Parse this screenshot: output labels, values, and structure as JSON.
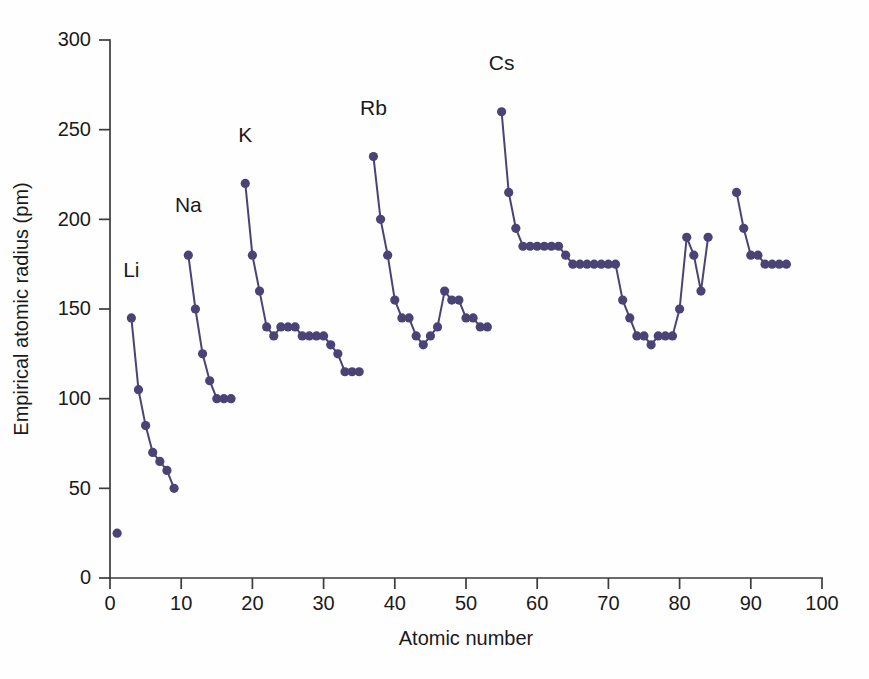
{
  "chart_data": {
    "type": "line",
    "title": "",
    "xlabel": "Atomic number",
    "ylabel": "Empirical atomic radius (pm)",
    "xlim": [
      0,
      100
    ],
    "ylim": [
      0,
      300
    ],
    "xticks": [
      0,
      10,
      20,
      30,
      40,
      50,
      60,
      70,
      80,
      90,
      100
    ],
    "yticks": [
      0,
      50,
      100,
      150,
      200,
      250,
      300
    ],
    "grid": false,
    "legend": "none",
    "marker": "filled-circle",
    "color": "#4a4376",
    "annotations": [
      {
        "text": "Li",
        "x": 3,
        "y": 168
      },
      {
        "text": "Na",
        "x": 11,
        "y": 204
      },
      {
        "text": "K",
        "x": 19,
        "y": 243
      },
      {
        "text": "Rb",
        "x": 37,
        "y": 258
      },
      {
        "text": "Cs",
        "x": 55,
        "y": 283
      }
    ],
    "series": [
      {
        "name": "hydrogen",
        "connected": false,
        "x": [
          1
        ],
        "values": [
          25
        ]
      },
      {
        "name": "period-2",
        "connected": true,
        "x": [
          3,
          4,
          5,
          6,
          7,
          8,
          9
        ],
        "values": [
          145,
          105,
          85,
          70,
          65,
          60,
          50
        ]
      },
      {
        "name": "period-3",
        "connected": true,
        "x": [
          11,
          12,
          13,
          14,
          15,
          16,
          17
        ],
        "values": [
          180,
          150,
          125,
          110,
          100,
          100,
          100
        ]
      },
      {
        "name": "period-4",
        "connected": true,
        "x": [
          19,
          20,
          21,
          22,
          23,
          24,
          25,
          26,
          27,
          28,
          29,
          30,
          31,
          32,
          33,
          34,
          35
        ],
        "values": [
          220,
          180,
          160,
          140,
          135,
          140,
          140,
          140,
          135,
          135,
          135,
          135,
          130,
          125,
          115,
          115,
          115
        ]
      },
      {
        "name": "period-5",
        "connected": true,
        "x": [
          37,
          38,
          39,
          40,
          41,
          42,
          43,
          44,
          45,
          46,
          47,
          48,
          49,
          50,
          51,
          52,
          53
        ],
        "values": [
          235,
          200,
          180,
          155,
          145,
          145,
          135,
          130,
          135,
          140,
          160,
          155,
          155,
          145,
          145,
          140,
          140
        ]
      },
      {
        "name": "period-6",
        "connected": true,
        "x": [
          55,
          56,
          57,
          58,
          59,
          60,
          61,
          62,
          63,
          64,
          65,
          66,
          67,
          68,
          69,
          70,
          71,
          72,
          73,
          74,
          75,
          76,
          77,
          78,
          79,
          80,
          81,
          82,
          83,
          84
        ],
        "values": [
          260,
          215,
          195,
          185,
          185,
          185,
          185,
          185,
          185,
          180,
          175,
          175,
          175,
          175,
          175,
          175,
          175,
          155,
          145,
          135,
          135,
          130,
          135,
          135,
          135,
          150,
          190,
          180,
          160,
          190
        ]
      },
      {
        "name": "period-7",
        "connected": true,
        "x": [
          88,
          89,
          90,
          91,
          92,
          93,
          94,
          95
        ],
        "values": [
          215,
          195,
          180,
          180,
          175,
          175,
          175,
          175
        ]
      }
    ]
  },
  "axes": {
    "x_tick_labels": [
      "0",
      "10",
      "20",
      "30",
      "40",
      "50",
      "60",
      "70",
      "80",
      "90",
      "100"
    ],
    "y_tick_labels": [
      "0",
      "50",
      "100",
      "150",
      "200",
      "250",
      "300"
    ],
    "x_title": "Atomic number",
    "y_title": "Empirical atomic radius (pm)"
  }
}
